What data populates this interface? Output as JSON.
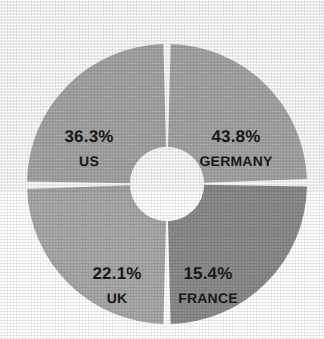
{
  "page": {
    "background_color": "#ffffff",
    "width": 324,
    "height": 339
  },
  "chart_data": {
    "type": "pie",
    "variant": "donut",
    "title": "",
    "subtitle": "",
    "xlabel": "",
    "ylabel": "",
    "legend_position": "none",
    "grid": false,
    "labels_inside_slices": true,
    "label_format": "percent_over_name",
    "center": {
      "x": 167,
      "y": 184
    },
    "outer_radius": 140,
    "inner_radius": 37,
    "gap_degrees": 3.0,
    "start_angle_degrees": 0,
    "categories": [
      "GERMANY",
      "FRANCE",
      "UK",
      "US"
    ],
    "values": [
      43.8,
      15.4,
      22.1,
      36.3
    ],
    "value_labels": [
      "43.8%",
      "15.4%",
      "22.1%",
      "36.3%"
    ],
    "slices": [
      {
        "name": "GERMANY",
        "value": 43.8,
        "value_label": "43.8%",
        "color": "#a9a9a9",
        "start_angle": 1.5,
        "end_angle": 88.0,
        "label_x": 236,
        "label_y": 148
      },
      {
        "name": "FRANCE",
        "value": 15.4,
        "value_label": "15.4%",
        "color": "#8c8c8c",
        "start_angle": 91.0,
        "end_angle": 178.5,
        "label_x": 208,
        "label_y": 285
      },
      {
        "name": "UK",
        "value": 22.1,
        "value_label": "22.1%",
        "color": "#a9a9a9",
        "start_angle": 181.5,
        "end_angle": 268.0,
        "label_x": 117,
        "label_y": 285
      },
      {
        "name": "US",
        "value": 36.3,
        "value_label": "36.3%",
        "color": "#a9a9a9",
        "start_angle": 271.0,
        "end_angle": 358.5,
        "label_x": 89,
        "label_y": 148
      }
    ],
    "colors": {
      "slice_light": "#a9a9a9",
      "slice_dark": "#8c8c8c",
      "separator": "#ffffff",
      "hole": "#ffffff",
      "label_text": "#1a1a1a",
      "background": "#ffffff"
    }
  }
}
